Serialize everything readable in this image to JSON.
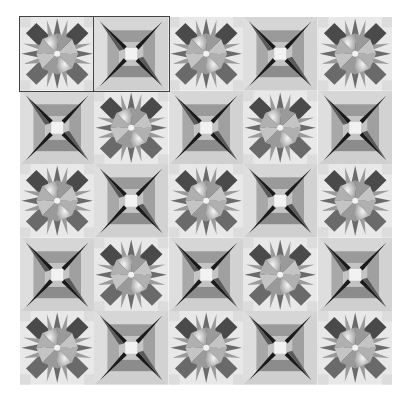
{
  "image": {
    "description": "5x5 grid of alternating grayscale quilt-block tiles",
    "rows": 5,
    "cols": 5,
    "tile_types": {
      "star": "eight-pointed star quilt block with rays",
      "frame": "framed square block with dark diagonal spikes toward a light center"
    },
    "layout": [
      [
        "star",
        "frame",
        "star",
        "frame",
        "star"
      ],
      [
        "frame",
        "star",
        "frame",
        "star",
        "frame"
      ],
      [
        "star",
        "frame",
        "star",
        "frame",
        "star"
      ],
      [
        "frame",
        "star",
        "frame",
        "star",
        "frame"
      ],
      [
        "star",
        "frame",
        "star",
        "frame",
        "star"
      ]
    ],
    "outlined_tiles": [
      [
        0,
        0
      ],
      [
        0,
        1
      ]
    ],
    "colors": {
      "background": "#ffffff",
      "light": "#e8e8e8",
      "mid_light": "#c4c4c4",
      "mid": "#9a9a9a",
      "dark": "#6a6a6a",
      "darker": "#4a4a4a",
      "black": "#1a1a1a",
      "outline": "#444444"
    }
  }
}
